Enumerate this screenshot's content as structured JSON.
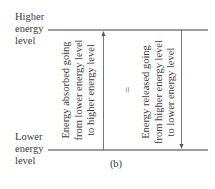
{
  "levels": {
    "higher": [
      "Higher",
      "energy",
      "level"
    ],
    "lower": [
      "Lower",
      "energy",
      "level"
    ]
  },
  "absorbed": {
    "lines": [
      "Energy absorbed going",
      "from lower energy level",
      "to higher energy level"
    ],
    "direction": "up"
  },
  "equals": "=",
  "released": {
    "lines": [
      "Energy released going",
      "from higher energy level",
      "to lower energy level"
    ],
    "direction": "down"
  },
  "caption": "(b)",
  "colors": {
    "line": "#3a3a3a",
    "arrow": "#555555",
    "text": "#3a3a3a"
  }
}
